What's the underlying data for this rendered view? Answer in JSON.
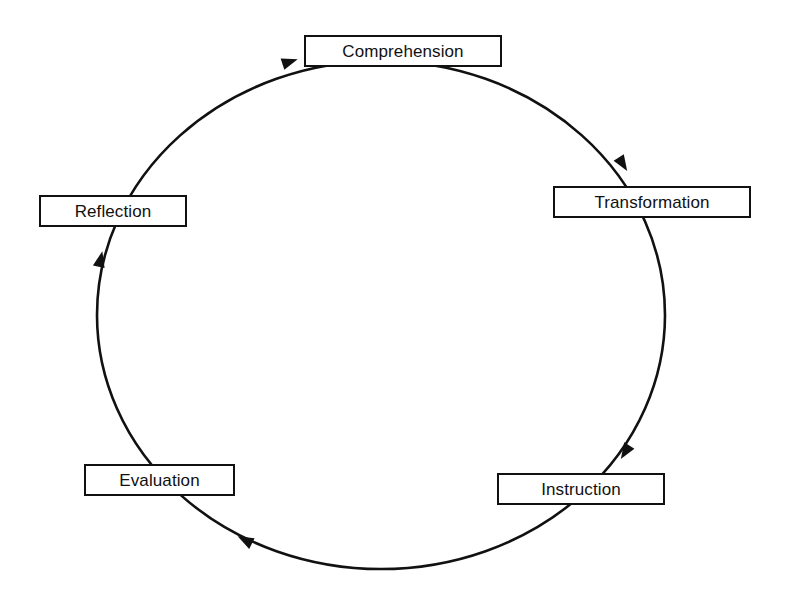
{
  "diagram": {
    "type": "cycle",
    "direction": "clockwise",
    "line_color": "#111111",
    "background_color": "#ffffff",
    "nodes": [
      {
        "id": "comprehension",
        "label": "Comprehension"
      },
      {
        "id": "transformation",
        "label": "Transformation"
      },
      {
        "id": "instruction",
        "label": "Instruction"
      },
      {
        "id": "evaluation",
        "label": "Evaluation"
      },
      {
        "id": "reflection",
        "label": "Reflection"
      }
    ],
    "edges": [
      {
        "from": "Comprehension",
        "to": "Transformation"
      },
      {
        "from": "Transformation",
        "to": "Instruction"
      },
      {
        "from": "Instruction",
        "to": "Evaluation"
      },
      {
        "from": "Evaluation",
        "to": "Reflection"
      },
      {
        "from": "Reflection",
        "to": "Comprehension"
      }
    ]
  }
}
